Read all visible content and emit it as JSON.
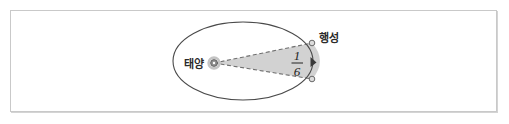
{
  "figure": {
    "frame": {
      "border_color": "#c9c9c9",
      "background": "#ffffff"
    },
    "labels": {
      "sun": "태양",
      "planet": "행성",
      "fraction_numerator": "1",
      "fraction_denominator": "6"
    },
    "colors": {
      "orbit_stroke": "#4a4a4a",
      "sector_fill": "#d2d2d2",
      "sector_dash_stroke": "#6f6f6f",
      "sun_body": "#9a9a9a",
      "sun_ring": "#b9b9b9",
      "marker_stroke": "#6a6a6a",
      "marker_fill": "#d8d8d8",
      "arrow_fill": "#3a3a3a",
      "text": "#2a2a2a"
    },
    "geometry": {
      "orbit_center_x": 243,
      "orbit_center_y": 61,
      "orbit_radius_x": 70,
      "orbit_radius_y": 39,
      "sun_x": 214,
      "sun_y": 63,
      "sun_radius": 4.5,
      "planet_upper_x": 312,
      "planet_upper_y": 43,
      "planet_lower_x": 312,
      "planet_lower_y": 79,
      "arrow_x": 312,
      "arrow_y": 62
    },
    "icons": {
      "sun": "sun-icon",
      "planet_upper": "planet-marker-icon",
      "planet_lower": "planet-marker-icon",
      "direction": "arrowhead-icon"
    }
  }
}
